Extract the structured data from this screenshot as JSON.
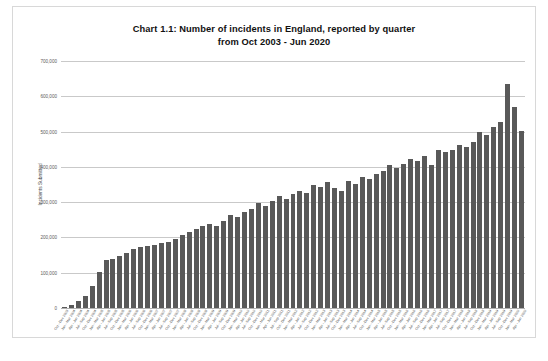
{
  "chart_data": {
    "type": "bar",
    "title": "Chart 1.1: Number of incidents in England, reported by quarter",
    "subtitle": "from Oct 2003 - Jun 2020",
    "xlabel": "",
    "ylabel": "Incidents Submitted",
    "ylim": [
      0,
      700000
    ],
    "ytick_labels": [
      "0",
      "100,000",
      "200,000",
      "300,000",
      "400,000",
      "500,000",
      "600,000",
      "700,000"
    ],
    "ytick_values": [
      0,
      100000,
      200000,
      300000,
      400000,
      500000,
      600000,
      700000
    ],
    "grid": true,
    "legend": "none",
    "bar_color": "#595959",
    "gridline_color": "#c9c9c9",
    "categories": [
      "Oct - Dec 2003",
      "Jan - Mar 2004",
      "Apr - Jun 2004",
      "Jul - Sep 2004",
      "Oct - Dec 2004",
      "Jan - Mar 2005",
      "Apr - Jun 2005",
      "Jul - Sep 2005",
      "Oct - Dec 2005",
      "Jan - Mar 2006",
      "Apr - Jun 2006",
      "Jul - Sep 2006",
      "Oct - Dec 2006",
      "Jan - Mar 2007",
      "Apr - Jun 2007",
      "Jul - Sep 2007",
      "Oct - Dec 2007",
      "Jan - Mar 2008",
      "Apr - Jun 2008",
      "Jul - Sep 2008",
      "Oct - Dec 2008",
      "Jan - Mar 2009",
      "Apr - Jun 2009",
      "Jul - Sep 2009",
      "Oct - Dec 2009",
      "Jan - Mar 2010",
      "Apr - Jun 2010",
      "Jul - Sep 2010",
      "Oct - Dec 2010",
      "Jan - Mar 2011",
      "Apr - Jun 2011",
      "Jul - Sep 2011",
      "Oct - Dec 2011",
      "Jan - Mar 2012",
      "Apr - Jun 2012",
      "Jul - Sep 2012",
      "Oct - Dec 2012",
      "Jan - Mar 2013",
      "Apr - Jun 2013",
      "Jul - Sep 2013",
      "Oct - Dec 2013",
      "Jan - Mar 2014",
      "Apr - Jun 2014",
      "Jul - Sep 2014",
      "Oct - Dec 2014",
      "Jan - Mar 2015",
      "Apr - Jun 2015",
      "Jul - Sep 2015",
      "Oct - Dec 2015",
      "Jan - Mar 2016",
      "Apr - Jun 2016",
      "Jul - Sep 2016",
      "Oct - Dec 2016",
      "Jan - Mar 2017",
      "Apr - Jun 2017",
      "Jul - Sep 2017",
      "Oct - Dec 2017",
      "Jan - Mar 2018",
      "Apr - Jun 2018",
      "Jul - Sep 2018",
      "Oct - Dec 2018",
      "Jan - Mar 2019",
      "Apr - Jun 2019",
      "Jul - Sep 2019",
      "Oct - Dec 2019",
      "Jan - Mar 2020",
      "Apr - Jun 2020"
    ],
    "values": [
      3000,
      9000,
      19000,
      33000,
      62000,
      103000,
      137000,
      139000,
      148000,
      155000,
      168000,
      172000,
      175000,
      178000,
      183000,
      186000,
      196000,
      208000,
      216000,
      224000,
      232000,
      239000,
      233000,
      246000,
      264000,
      258000,
      272000,
      281000,
      297000,
      289000,
      304000,
      317000,
      308000,
      322000,
      333000,
      326000,
      349000,
      343000,
      356000,
      341000,
      332000,
      361000,
      352000,
      372000,
      367000,
      379000,
      389000,
      404000,
      397000,
      409000,
      421000,
      416000,
      431000,
      404000,
      447000,
      441000,
      449000,
      461000,
      455000,
      471000,
      498000,
      489000,
      512000,
      526000,
      635000,
      571000,
      503000
    ]
  }
}
